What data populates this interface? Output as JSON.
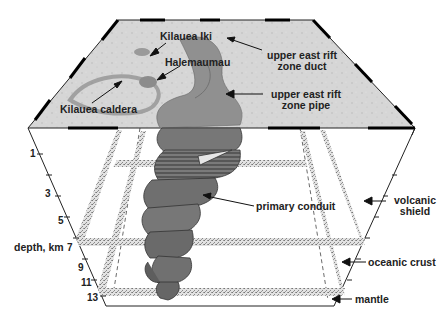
{
  "surface_labels": {
    "kilauea_iki": "Kilauea Iki",
    "halemaumau": "Halemaumau",
    "kilauea_caldera": "Kilauea caldera",
    "uer_duct_1": "upper east rift",
    "uer_duct_2": "zone duct",
    "uer_pipe_1": "upper east rift",
    "uer_pipe_2": "zone pipe"
  },
  "interior_labels": {
    "primary_conduit": "primary conduit"
  },
  "depth_axis": {
    "label": "depth, km",
    "ticks": [
      "1",
      "3",
      "5",
      "7",
      "9",
      "11",
      "13"
    ]
  },
  "layer_labels": {
    "volcanic_shield_1": "volcanic",
    "volcanic_shield_2": "shield",
    "oceanic_crust": "oceanic crust",
    "mantle": "mantle"
  },
  "colors": {
    "surface": "#d9d9d9",
    "conduit": "#6f6f6f",
    "conduit_dark": "#555555",
    "band": "#bdbdbd",
    "line": "#222222"
  }
}
